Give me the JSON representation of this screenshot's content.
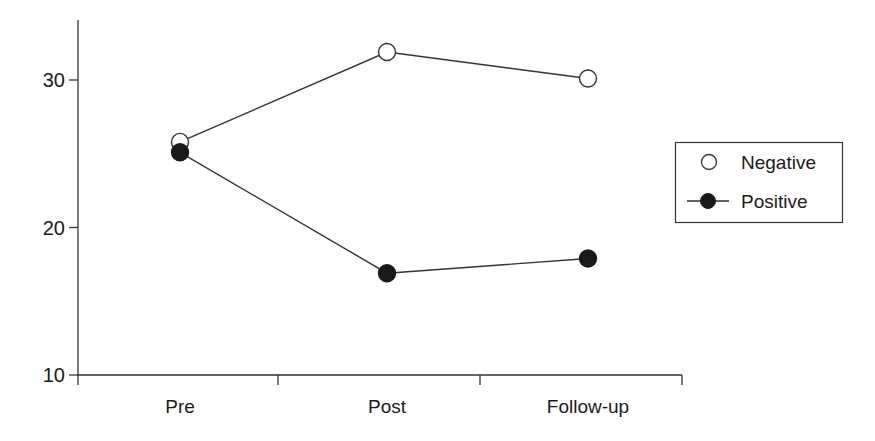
{
  "chart_data": {
    "type": "line",
    "title": "",
    "xlabel": "",
    "ylabel": "",
    "categories": [
      "Pre",
      "Post",
      "Follow-up"
    ],
    "ylim": [
      10,
      34
    ],
    "yticks": [
      10,
      20,
      30
    ],
    "grid": false,
    "legend_position": "right",
    "series": [
      {
        "name": "Negative",
        "marker": "open-circle",
        "values": [
          25.8,
          31.9,
          30.1
        ]
      },
      {
        "name": "Positive",
        "marker": "filled-circle",
        "values": [
          25.1,
          16.9,
          17.9
        ]
      }
    ]
  },
  "legend": {
    "items": [
      {
        "label": "Negative",
        "marker": "open-circle-icon"
      },
      {
        "label": "Positive",
        "marker": "filled-circle-line-icon"
      }
    ]
  },
  "colors": {
    "line": "#333333",
    "marker_fill_positive": "#1a1a1a",
    "marker_fill_negative": "#ffffff",
    "axis": "#333333",
    "text": "#1a1a1a"
  }
}
